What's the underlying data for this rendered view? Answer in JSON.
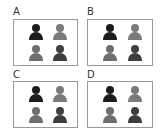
{
  "options": [
    {
      "label": "A",
      "figures": [
        {
          "position": "top-left",
          "color": "#1c1c1c"
        },
        {
          "position": "top-right",
          "color": "#7a7a7a"
        },
        {
          "position": "bottom-left",
          "color": "#6e6e6e"
        },
        {
          "position": "bottom-right",
          "color": "#3e3e3e"
        }
      ]
    },
    {
      "label": "B",
      "figures": [
        {
          "position": "top-left",
          "color": "#1c1c1c"
        },
        {
          "position": "top-right",
          "color": "#7a7a7a"
        },
        {
          "position": "bottom-left",
          "color": "#6e6e6e"
        },
        {
          "position": "bottom-right",
          "color": "#3e3e3e"
        }
      ]
    },
    {
      "label": "C",
      "figures": [
        {
          "position": "top-left",
          "color": "#1c1c1c"
        },
        {
          "position": "top-right",
          "color": "#7a7a7a"
        },
        {
          "position": "bottom-left",
          "color": "#6e6e6e"
        },
        {
          "position": "bottom-right",
          "color": "#3e3e3e"
        }
      ]
    },
    {
      "label": "D",
      "figures": [
        {
          "position": "top-left",
          "color": "#1c1c1c"
        },
        {
          "position": "top-right",
          "color": "#7a7a7a"
        },
        {
          "position": "bottom-left",
          "color": "#6e6e6e"
        },
        {
          "position": "bottom-right",
          "color": "#3e3e3e"
        }
      ]
    }
  ],
  "icon": "person-icon"
}
